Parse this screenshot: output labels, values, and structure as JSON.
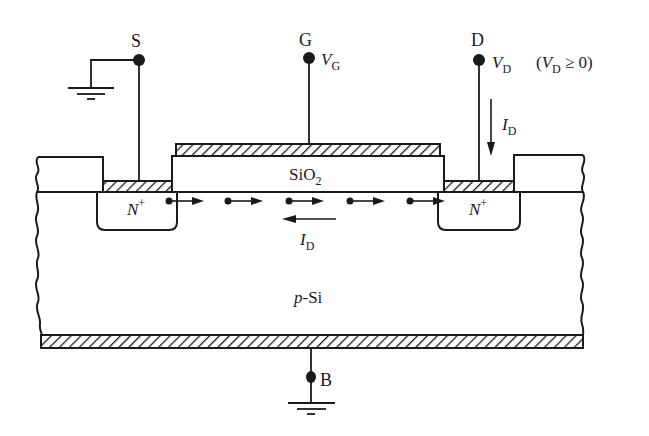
{
  "diagram": {
    "terminals": {
      "source": {
        "label": "S",
        "grounded": true
      },
      "gate": {
        "label": "G",
        "voltage": "V",
        "voltage_sub": "G"
      },
      "drain": {
        "label": "D",
        "voltage": "V",
        "voltage_sub": "D",
        "condition_open": "(",
        "condition_var": "V",
        "condition_sub": "D",
        "condition_rest": " ≥ 0)"
      },
      "body": {
        "label": "B",
        "grounded": true
      }
    },
    "regions": {
      "oxide": {
        "label": "SiO",
        "sub": "2"
      },
      "source_well": {
        "label": "N",
        "sup": "+"
      },
      "drain_well": {
        "label": "N",
        "sup": "+"
      },
      "substrate": {
        "label_italic": "p",
        "label_rest": "-Si"
      }
    },
    "currents": {
      "drain_current": {
        "label": "I",
        "sub": "D",
        "direction": "down"
      },
      "channel_current": {
        "label": "I",
        "sub": "D",
        "direction": "left"
      }
    },
    "electron_flow": {
      "count": 5,
      "direction": "right"
    },
    "colors": {
      "ink": "#1a1a1a",
      "background": "#ffffff"
    }
  }
}
